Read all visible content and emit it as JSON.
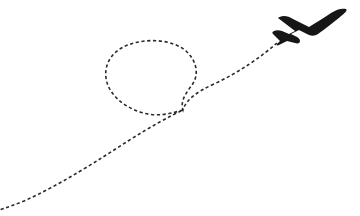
{
  "canvas": {
    "width": 360,
    "height": 216,
    "background_color": "#ffffff",
    "title": "Airplane with dashed looping flight trail"
  },
  "artwork": {
    "name": "airplane-trail-illustration",
    "style": "flat silhouette line art",
    "element_count": 2
  },
  "trail": {
    "name": "flight-trail",
    "description": "Dashed curved flight path forming a loop then sweeping to the lower-left edge",
    "stroke_color": "#2a2a2a",
    "stroke_width": 1.6,
    "dash_length": 3.2,
    "dash_gap": 2.6,
    "dash_array": "3.2 2.6",
    "fill": "none",
    "path": "M 277 43 C 262 56, 240 72, 214 84 C 196 92, 186 100, 183 110 C 180 101, 186 93, 192 85 C 200 74, 196 60, 186 51 C 172 39, 146 38, 128 45 C 112 51, 104 64, 106 78 C 108 93, 122 106, 140 112 C 158 118, 172 113, 183 110 C 170 116, 150 127, 128 141 C 100 159, 62 184, 24 201 C 14 205, 6 208, -4 211",
    "start_point": [
      277,
      43
    ],
    "end_point": [
      -4,
      211
    ],
    "loop_center": [
      148,
      79
    ],
    "loop_radius_x": 41,
    "loop_radius_y": 34,
    "crossing_point": [
      183,
      110
    ]
  },
  "airplane": {
    "name": "airplane-silhouette",
    "description": "Dark filled airplane silhouette flying up and to the right",
    "fill_color": "#161616",
    "heading": "up-right",
    "bounding_box": {
      "x": 274,
      "y": 7,
      "width": 72,
      "height": 37
    },
    "path": "M 346 9 C 342 8, 337 9, 331 13 C 325 17, 317 22, 309 27 L 293 19 C 290 17, 287 16, 284 16 C 281 16, 279 17, 278 18 L 295 31 L 289 34 L 282 31 C 279 30, 276 30, 274 31 C 272 32, 272 33, 273 34 L 280 41 L 277 44 C 276 45, 277 46, 279 45 L 287 41 L 295 43 C 298 44, 300 43, 300 41 C 300 39, 298 37, 295 36 L 291 34 L 299 30 L 309 35 C 312 36, 315 36, 318 34 C 325 29, 334 22, 340 17 C 345 13, 348 10, 346 9 Z"
  }
}
